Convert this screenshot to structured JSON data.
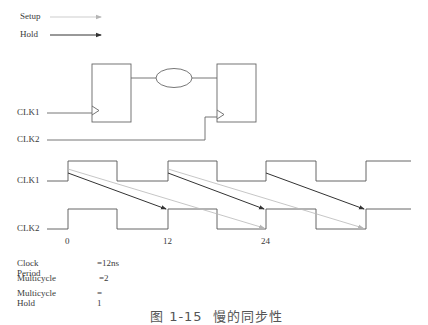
{
  "legend": {
    "items": [
      {
        "label": "Setup",
        "style": "light-gray-arrow",
        "color": "#b5b5b5"
      },
      {
        "label": "Hold",
        "style": "dark-arrow",
        "color": "#333333"
      }
    ]
  },
  "schematic": {
    "inputs": [
      {
        "label": "CLK1"
      },
      {
        "label": "CLK2"
      }
    ],
    "elements": [
      "launch-flip-flop",
      "combinational-logic",
      "capture-flip-flop"
    ]
  },
  "waveforms": {
    "signals": [
      {
        "label": "CLK1"
      },
      {
        "label": "CLK2"
      }
    ],
    "ticks": [
      "0",
      "12",
      "24"
    ]
  },
  "params": {
    "rows": [
      {
        "key": "Clock Period",
        "value": "=12ns"
      },
      {
        "key": "Multicycle",
        "value": "=2"
      },
      {
        "key": "Multicycle Hold",
        "value": "= 1"
      }
    ]
  },
  "caption": "图 1-15  慢的同步性",
  "colors": {
    "line": "#555555",
    "setup_arrow": "#b5b5b5",
    "hold_arrow": "#333333"
  }
}
